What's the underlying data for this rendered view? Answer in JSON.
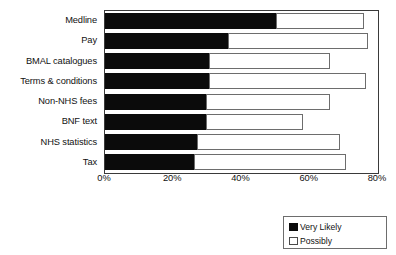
{
  "chart_data": {
    "type": "bar",
    "orientation": "horizontal",
    "stacked": true,
    "title": "",
    "subtitle": "",
    "xlabel": "",
    "ylabel": "",
    "xlim": [
      0,
      80
    ],
    "xtick_labels": [
      "0%",
      "20%",
      "40%",
      "60%",
      "80%"
    ],
    "xtick_values": [
      0,
      20,
      40,
      60,
      80
    ],
    "grid": false,
    "legend_position": "bottom-right",
    "categories": [
      "Medline",
      "Pay",
      "BMAL catalogues",
      "Terms & conditions",
      "Non-NHS fees",
      "BNF text",
      "NHS statistics",
      "Tax"
    ],
    "series": [
      {
        "name": "Very Likely",
        "color": "#0b0b0b",
        "values": [
          50,
          36,
          30.5,
          30.5,
          29.5,
          29.5,
          27,
          26
        ]
      },
      {
        "name": "Possibly",
        "color": "#ffffff",
        "values": [
          26,
          41,
          35.5,
          46,
          36.5,
          28.5,
          42,
          44.5
        ]
      }
    ],
    "cumulative_totals": [
      76,
      77,
      66,
      76.5,
      66,
      58,
      69,
      70.5
    ]
  },
  "legend": {
    "items": [
      {
        "label": "Very Likely",
        "swatch": "filled"
      },
      {
        "label": "Possibly",
        "swatch": "hollow"
      }
    ]
  }
}
